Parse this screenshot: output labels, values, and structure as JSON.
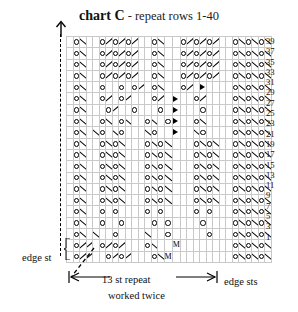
{
  "title": {
    "main": "chart C",
    "sub": " - repeat rows 1-40"
  },
  "labels": {
    "edge_st": "edge st",
    "edge_sts": "edge sts",
    "repeat": "13 st repeat",
    "worked": "worked twice"
  },
  "colors": {
    "grid_line": "#c9c9c9",
    "heavy_line": "#000000",
    "symbol": "#000000",
    "background": "#ffffff",
    "text": "#111111"
  },
  "legend": {
    "o": "yarn-over",
    "bs": "ssk-decrease",
    "fs": "k2tog-decrease",
    "m": "M",
    "tri": "double-decrease"
  },
  "chart_data": {
    "type": "table",
    "title": "chart C",
    "subtitle": "repeat rows 1-40",
    "columns": 31,
    "rows": 20,
    "row_numbers": [
      39,
      37,
      35,
      33,
      31,
      29,
      27,
      25,
      23,
      21,
      19,
      17,
      15,
      13,
      11,
      9,
      7,
      5,
      3,
      1
    ],
    "repeat_start_col": 1,
    "repeat_end_col": 26,
    "edge_sts_start_col": 27,
    "dashed_divider_after_row_index": 9,
    "symbol_key": {
      "o": "yarn over (circle)",
      "bs": "backslash decrease",
      "fs": "forward slash decrease",
      "m": "make one (M)",
      "tri": "solid triangle double decrease",
      "blank": "knit (empty cell)"
    },
    "grid": [
      [
        "blank",
        "o",
        "bs",
        "blank",
        "blank",
        "o",
        "fs",
        "o",
        "fs",
        "o",
        "fs",
        "blank",
        "blank",
        "o",
        "bs",
        "blank",
        "blank",
        "o",
        "fs",
        "o",
        "fs",
        "o",
        "fs",
        "blank",
        "blank",
        "o",
        "bs",
        "o",
        "bs",
        "o",
        "bs"
      ],
      [
        "blank",
        "o",
        "bs",
        "blank",
        "blank",
        "o",
        "fs",
        "o",
        "fs",
        "o",
        "fs",
        "blank",
        "blank",
        "o",
        "bs",
        "blank",
        "blank",
        "o",
        "fs",
        "o",
        "fs",
        "o",
        "fs",
        "blank",
        "blank",
        "o",
        "bs",
        "o",
        "bs",
        "o",
        "bs"
      ],
      [
        "blank",
        "o",
        "bs",
        "blank",
        "blank",
        "o",
        "fs",
        "o",
        "fs",
        "o",
        "fs",
        "blank",
        "blank",
        "o",
        "bs",
        "blank",
        "blank",
        "o",
        "fs",
        "o",
        "fs",
        "o",
        "fs",
        "blank",
        "blank",
        "o",
        "bs",
        "o",
        "bs",
        "o",
        "bs"
      ],
      [
        "blank",
        "o",
        "bs",
        "blank",
        "blank",
        "o",
        "fs",
        "o",
        "fs",
        "o",
        "fs",
        "blank",
        "blank",
        "o",
        "bs",
        "blank",
        "blank",
        "o",
        "fs",
        "o",
        "fs",
        "o",
        "fs",
        "blank",
        "blank",
        "o",
        "bs",
        "o",
        "bs",
        "o",
        "bs"
      ],
      [
        "blank",
        "o",
        "bs",
        "blank",
        "blank",
        "o",
        "blank",
        "blank",
        "o",
        "blank",
        "o",
        "fs",
        "blank",
        "o",
        "bs",
        "blank",
        "blank",
        "o",
        "fs",
        "blank",
        "tri",
        "blank",
        "blank",
        "blank",
        "blank",
        "o",
        "bs",
        "o",
        "bs",
        "o",
        "bs"
      ],
      [
        "blank",
        "o",
        "bs",
        "blank",
        "blank",
        "o",
        "fs",
        "blank",
        "o",
        "fs",
        "blank",
        "blank",
        "blank",
        "o",
        "fs",
        "blank",
        "tri",
        "blank",
        "blank",
        "o",
        "fs",
        "blank",
        "blank",
        "blank",
        "blank",
        "o",
        "bs",
        "o",
        "bs",
        "o",
        "bs"
      ],
      [
        "blank",
        "o",
        "bs",
        "blank",
        "blank",
        "blank",
        "o",
        "fs",
        "blank",
        "blank",
        "o",
        "blank",
        "blank",
        "blank",
        "o",
        "blank",
        "tri",
        "blank",
        "blank",
        "blank",
        "o",
        "blank",
        "blank",
        "blank",
        "blank",
        "o",
        "bs",
        "o",
        "bs",
        "o",
        "bs"
      ],
      [
        "blank",
        "o",
        "bs",
        "blank",
        "blank",
        "o",
        "bs",
        "blank",
        "o",
        "bs",
        "blank",
        "blank",
        "o",
        "bs",
        "blank",
        "o",
        "tri",
        "blank",
        "blank",
        "o",
        "bs",
        "blank",
        "blank",
        "blank",
        "blank",
        "o",
        "bs",
        "o",
        "bs",
        "o",
        "bs"
      ],
      [
        "blank",
        "o",
        "bs",
        "blank",
        "bs",
        "o",
        "blank",
        "bs",
        "o",
        "blank",
        "blank",
        "blank",
        "bs",
        "o",
        "blank",
        "blank",
        "tri",
        "blank",
        "blank",
        "bs",
        "o",
        "blank",
        "blank",
        "blank",
        "blank",
        "o",
        "bs",
        "o",
        "bs",
        "o",
        "bs"
      ],
      [
        "blank",
        "o",
        "bs",
        "blank",
        "blank",
        "o",
        "bs",
        "o",
        "bs",
        "blank",
        "blank",
        "blank",
        "o",
        "bs",
        "o",
        "bs",
        "blank",
        "blank",
        "blank",
        "o",
        "bs",
        "o",
        "bs",
        "blank",
        "blank",
        "o",
        "bs",
        "o",
        "bs",
        "o",
        "bs"
      ],
      [
        "blank",
        "o",
        "bs",
        "blank",
        "blank",
        "o",
        "bs",
        "o",
        "bs",
        "blank",
        "blank",
        "blank",
        "o",
        "bs",
        "o",
        "bs",
        "blank",
        "blank",
        "blank",
        "o",
        "bs",
        "o",
        "bs",
        "blank",
        "blank",
        "o",
        "bs",
        "o",
        "bs",
        "o",
        "bs"
      ],
      [
        "blank",
        "o",
        "bs",
        "blank",
        "blank",
        "o",
        "bs",
        "o",
        "bs",
        "blank",
        "blank",
        "blank",
        "o",
        "bs",
        "o",
        "bs",
        "blank",
        "blank",
        "blank",
        "o",
        "bs",
        "o",
        "bs",
        "blank",
        "blank",
        "o",
        "bs",
        "o",
        "bs",
        "o",
        "bs"
      ],
      [
        "blank",
        "o",
        "bs",
        "blank",
        "blank",
        "o",
        "bs",
        "o",
        "bs",
        "blank",
        "blank",
        "blank",
        "o",
        "bs",
        "o",
        "bs",
        "blank",
        "blank",
        "blank",
        "o",
        "bs",
        "o",
        "bs",
        "blank",
        "blank",
        "o",
        "bs",
        "o",
        "bs",
        "o",
        "bs"
      ],
      [
        "blank",
        "o",
        "bs",
        "blank",
        "blank",
        "o",
        "bs",
        "o",
        "bs",
        "blank",
        "blank",
        "blank",
        "o",
        "bs",
        "o",
        "bs",
        "blank",
        "blank",
        "blank",
        "o",
        "bs",
        "o",
        "bs",
        "blank",
        "blank",
        "o",
        "bs",
        "o",
        "bs",
        "o",
        "bs"
      ],
      [
        "blank",
        "o",
        "bs",
        "blank",
        "blank",
        "o",
        "bs",
        "o",
        "bs",
        "blank",
        "blank",
        "blank",
        "o",
        "bs",
        "o",
        "bs",
        "blank",
        "blank",
        "blank",
        "o",
        "bs",
        "o",
        "bs",
        "blank",
        "blank",
        "o",
        "bs",
        "o",
        "bs",
        "o",
        "bs"
      ],
      [
        "blank",
        "o",
        "bs",
        "blank",
        "blank",
        "o",
        "blank",
        "o",
        "blank",
        "blank",
        "blank",
        "blank",
        "o",
        "blank",
        "o",
        "blank",
        "blank",
        "blank",
        "blank",
        "o",
        "blank",
        "o",
        "blank",
        "blank",
        "blank",
        "o",
        "bs",
        "o",
        "bs",
        "o",
        "bs"
      ],
      [
        "blank",
        "o",
        "bs",
        "blank",
        "blank",
        "o",
        "blank",
        "blank",
        "o",
        "blank",
        "blank",
        "blank",
        "blank",
        "o",
        "blank",
        "o",
        "blank",
        "blank",
        "blank",
        "blank",
        "o",
        "blank",
        "blank",
        "blank",
        "blank",
        "o",
        "bs",
        "o",
        "bs",
        "o",
        "bs"
      ],
      [
        "blank",
        "o",
        "bs",
        "blank",
        "bs",
        "blank",
        "blank",
        "o",
        "blank",
        "blank",
        "blank",
        "blank",
        "bs",
        "blank",
        "blank",
        "o",
        "blank",
        "blank",
        "blank",
        "blank",
        "blank",
        "o",
        "blank",
        "blank",
        "blank",
        "o",
        "bs",
        "o",
        "bs",
        "o",
        "bs"
      ],
      [
        "blank",
        "o",
        "fs",
        "fs",
        "blank",
        "o",
        "fs",
        "o",
        "fs",
        "blank",
        "blank",
        "blank",
        "o",
        "bs",
        "blank",
        "blank",
        "m",
        "blank",
        "blank",
        "blank",
        "blank",
        "blank",
        "blank",
        "blank",
        "blank",
        "o",
        "bs",
        "o",
        "bs",
        "o",
        "bs"
      ],
      [
        "blank",
        "o",
        "fs",
        "fs",
        "blank",
        "blank",
        "o",
        "fs",
        "o",
        "fs",
        "blank",
        "blank",
        "blank",
        "o",
        "bs",
        "m",
        "blank",
        "blank",
        "blank",
        "blank",
        "blank",
        "blank",
        "blank",
        "blank",
        "blank",
        "o",
        "bs",
        "o",
        "bs",
        "o",
        "bs"
      ]
    ]
  }
}
